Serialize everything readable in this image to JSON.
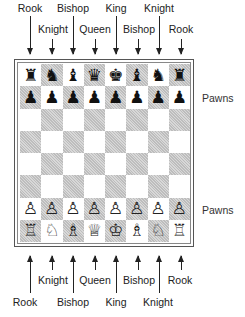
{
  "top_labels": {
    "upper_row": [
      {
        "text": "Rook",
        "x": 30
      },
      {
        "text": "Bishop",
        "x": 73
      },
      {
        "text": "King",
        "x": 116
      },
      {
        "text": "Knight",
        "x": 159
      }
    ],
    "lower_row": [
      {
        "text": "Knight",
        "x": 52
      },
      {
        "text": "Queen",
        "x": 95
      },
      {
        "text": "Bishop",
        "x": 138
      },
      {
        "text": "Rook",
        "x": 181
      }
    ]
  },
  "bottom_labels": {
    "upper_row": [
      {
        "text": "Knight",
        "x": 52
      },
      {
        "text": "Queen",
        "x": 95
      },
      {
        "text": "Bishop",
        "x": 138
      },
      {
        "text": "Rook",
        "x": 181
      }
    ],
    "lower_row": [
      {
        "text": "Rook",
        "x": 30
      },
      {
        "text": "Bishop",
        "x": 73
      },
      {
        "text": "King",
        "x": 116
      },
      {
        "text": "Knight",
        "x": 159
      }
    ]
  },
  "side_labels": {
    "black_pawns": "Pawns",
    "white_pawns": "Pawns"
  },
  "board": {
    "rows": [
      [
        "♜",
        "♞",
        "♝",
        "♛",
        "♚",
        "♝",
        "♞",
        "♜"
      ],
      [
        "♟",
        "♟",
        "♟",
        "♟",
        "♟",
        "♟",
        "♟",
        "♟"
      ],
      [
        "",
        "",
        "",
        "",
        "",
        "",
        "",
        ""
      ],
      [
        "",
        "",
        "",
        "",
        "",
        "",
        "",
        ""
      ],
      [
        "",
        "",
        "",
        "",
        "",
        "",
        "",
        ""
      ],
      [
        "",
        "",
        "",
        "",
        "",
        "",
        "",
        ""
      ],
      [
        "♙",
        "♙",
        "♙",
        "♙",
        "♙",
        "♙",
        "♙",
        "♙"
      ],
      [
        "♖",
        "♘",
        "♗",
        "♕",
        "♔",
        "♗",
        "♘",
        "♖"
      ]
    ],
    "colors": {
      "light_square": "#ffffff",
      "dark_square_hatch": "#c8c8c8",
      "frame": "#555555"
    }
  }
}
